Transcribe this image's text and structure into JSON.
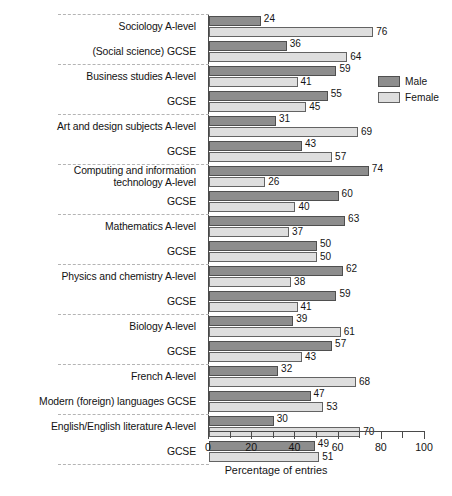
{
  "chart_data": {
    "type": "bar",
    "orientation": "horizontal",
    "title": "",
    "xlabel": "Percentage of entries",
    "ylabel": "",
    "xlim": [
      0,
      100
    ],
    "xticks": [
      0,
      20,
      40,
      60,
      80,
      100
    ],
    "xtick_labels": [
      "0",
      "20",
      "40",
      "60",
      "80",
      "100"
    ],
    "minor_tick_step": 10,
    "grid": false,
    "legend_position": "top-right",
    "series": [
      {
        "name": "Male",
        "color": "#8d8d8d",
        "values": [
          24,
          36,
          59,
          55,
          31,
          43,
          74,
          60,
          63,
          50,
          62,
          59,
          39,
          57,
          32,
          47,
          30,
          49
        ]
      },
      {
        "name": "Female",
        "color": "#dedede",
        "values": [
          76,
          64,
          41,
          45,
          69,
          57,
          26,
          40,
          37,
          50,
          38,
          41,
          61,
          43,
          68,
          53,
          70,
          51
        ]
      }
    ],
    "categories": [
      "Sociology A-level",
      "(Social science) GCSE",
      "Business studies A-level",
      "GCSE",
      "Art and design subjects A-level",
      "GCSE",
      "Computing and information\ntechnology A-level",
      "GCSE",
      "Mathematics A-level",
      "GCSE",
      "Physics and chemistry A-level",
      "GCSE",
      "Biology A-level",
      "GCSE",
      "French A-level",
      "Modern (foreign) languages GCSE",
      "English/English literature A-level",
      "GCSE"
    ],
    "rows": [
      {
        "label": "Sociology A-level",
        "male": 24,
        "female": 76,
        "group": 0
      },
      {
        "label": "(Social science) GCSE",
        "male": 36,
        "female": 64,
        "group": 0
      },
      {
        "label": "Business studies A-level",
        "male": 59,
        "female": 41,
        "group": 1
      },
      {
        "label": "GCSE",
        "male": 55,
        "female": 45,
        "group": 1
      },
      {
        "label": "Art and design subjects A-level",
        "male": 31,
        "female": 69,
        "group": 2
      },
      {
        "label": "GCSE",
        "male": 43,
        "female": 57,
        "group": 2
      },
      {
        "label": "Computing and information\ntechnology A-level",
        "male": 74,
        "female": 26,
        "group": 3
      },
      {
        "label": "GCSE",
        "male": 60,
        "female": 40,
        "group": 3
      },
      {
        "label": "Mathematics A-level",
        "male": 63,
        "female": 37,
        "group": 4
      },
      {
        "label": "GCSE",
        "male": 50,
        "female": 50,
        "group": 4
      },
      {
        "label": "Physics and chemistry A-level",
        "male": 62,
        "female": 38,
        "group": 5
      },
      {
        "label": "GCSE",
        "male": 59,
        "female": 41,
        "group": 5
      },
      {
        "label": "Biology A-level",
        "male": 39,
        "female": 61,
        "group": 6
      },
      {
        "label": "GCSE",
        "male": 57,
        "female": 43,
        "group": 6
      },
      {
        "label": "French A-level",
        "male": 32,
        "female": 68,
        "group": 7
      },
      {
        "label": "Modern (foreign) languages GCSE",
        "male": 47,
        "female": 53,
        "group": 7
      },
      {
        "label": "English/English literature A-level",
        "male": 30,
        "female": 70,
        "group": 8
      },
      {
        "label": "GCSE",
        "male": 49,
        "female": 51,
        "group": 8
      }
    ]
  },
  "legend": {
    "items": [
      {
        "label": "Male",
        "color": "#8d8d8d"
      },
      {
        "label": "Female",
        "color": "#dedede"
      }
    ]
  },
  "axis": {
    "title": "Percentage of entries",
    "labels": [
      "0",
      "20",
      "40",
      "60",
      "80",
      "100"
    ]
  }
}
